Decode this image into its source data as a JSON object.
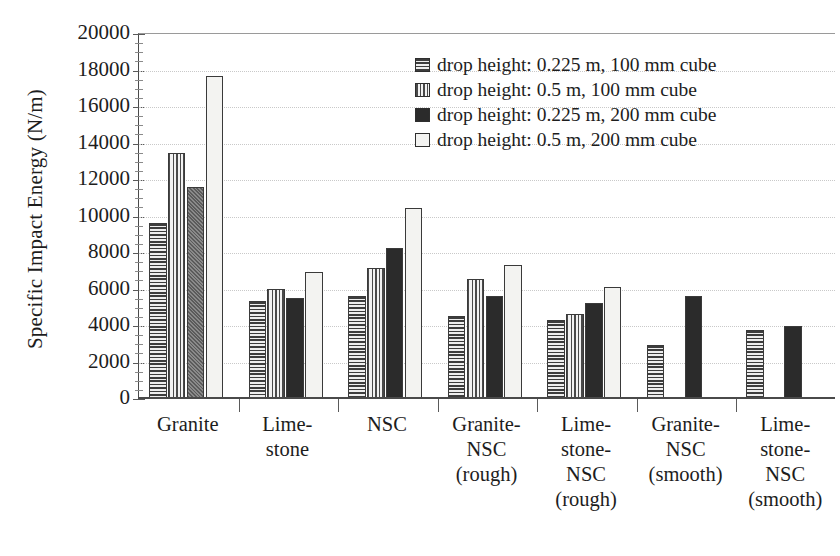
{
  "chart_data": {
    "type": "bar",
    "title": "",
    "xlabel": "",
    "ylabel": "Specific Impact Energy (N/m)",
    "ylim": [
      0,
      20000
    ],
    "ytick_step": 2000,
    "yticks": [
      "0",
      "2000",
      "4000",
      "6000",
      "8000",
      "10000",
      "12000",
      "14000",
      "16000",
      "18000",
      "20000"
    ],
    "grid": true,
    "legend_position": "top-right",
    "categories": [
      "Granite",
      "Limestone",
      "NSC",
      "Granite-NSC (rough)",
      "Limestone-NSC (rough)",
      "Granite-NSC (smooth)",
      "Limestone-NSC (smooth)"
    ],
    "category_lines": [
      [
        "Granite"
      ],
      [
        "Lime-",
        "stone"
      ],
      [
        "NSC"
      ],
      [
        "Granite-",
        "NSC",
        "(rough)"
      ],
      [
        "Lime-",
        "stone-",
        "NSC",
        "(rough)"
      ],
      [
        "Granite-",
        "NSC",
        "(smooth)"
      ],
      [
        "Lime-",
        "stone-",
        "NSC",
        "(smooth)"
      ]
    ],
    "series": [
      {
        "name": "drop height: 0.225 m, 100 mm cube",
        "pattern": "horizontal-lines",
        "values": [
          9600,
          5300,
          5600,
          4500,
          4300,
          2900,
          3700
        ]
      },
      {
        "name": "drop height: 0.5 m, 100 mm cube",
        "pattern": "vertical-lines",
        "values": [
          13400,
          6000,
          7100,
          6500,
          4600,
          null,
          null
        ]
      },
      {
        "name": "drop height: 0.225 m, 200 mm cube",
        "pattern": "solid-black",
        "values": [
          11550,
          5500,
          8200,
          5600,
          5200,
          5600,
          3950
        ]
      },
      {
        "name": "drop height: 0.5 m, 200 mm cube",
        "pattern": "white",
        "values": [
          17650,
          6900,
          10400,
          7300,
          6100,
          null,
          null
        ]
      }
    ]
  },
  "legend": {
    "items": [
      {
        "label": "drop height: 0.225 m, 100 mm cube",
        "pattern": "horizontal-lines"
      },
      {
        "label": "drop height: 0.5 m, 100 mm cube",
        "pattern": "vertical-lines"
      },
      {
        "label": "drop height: 0.225 m, 200 mm cube",
        "pattern": "solid-black"
      },
      {
        "label": "drop height: 0.5 m, 200 mm cube",
        "pattern": "white"
      }
    ]
  },
  "colors": {
    "axis": "#4a4a4a",
    "grid": "#c9c9c9",
    "ink": "#1d1d1d",
    "solid": "#2b2b2b",
    "white_bar": "#f3f3f1"
  }
}
